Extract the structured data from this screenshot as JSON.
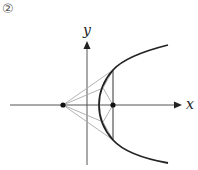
{
  "figure": {
    "number_label": "②",
    "x_axis_label": "x",
    "y_axis_label": "y"
  },
  "colors": {
    "curve": "#222222",
    "axes": "#555555",
    "construction": "#aaaaaa",
    "points": "#111111"
  },
  "geometry": {
    "origin": [
      87,
      105
    ],
    "left_point": [
      63,
      105
    ],
    "right_point": [
      113,
      105
    ],
    "vertex": [
      99,
      105
    ],
    "chord_top": [
      113,
      70
    ],
    "chord_bottom": [
      113,
      140
    ],
    "mid_upper": [
      103,
      88
    ],
    "mid_lower": [
      103,
      122
    ]
  }
}
